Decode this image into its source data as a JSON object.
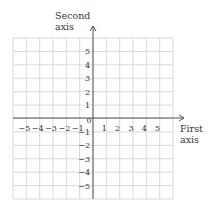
{
  "chart_data": {
    "type": "coordinate-grid",
    "title": "",
    "xlabel": "First axis",
    "ylabel": "Second axis",
    "x_ticks": [
      "−5",
      "−4",
      "−3",
      "−2",
      "−1",
      "0",
      "1",
      "2",
      "3",
      "4",
      "5"
    ],
    "y_ticks_positive": [
      "5",
      "4",
      "3",
      "2",
      "1"
    ],
    "y_ticks_negative": [
      "−1",
      "−2",
      "−3",
      "−4",
      "−5"
    ],
    "xlim": [
      -6,
      6
    ],
    "ylim": [
      -6,
      6
    ],
    "grid": true,
    "series": []
  },
  "labels": {
    "y_axis_line1": "Second",
    "y_axis_line2": "axis",
    "x_axis_line1": "First",
    "x_axis_line2": "axis",
    "origin": "0"
  },
  "colors": {
    "grid": "#d9d9d9",
    "axis": "#555555",
    "text": "#333333"
  }
}
